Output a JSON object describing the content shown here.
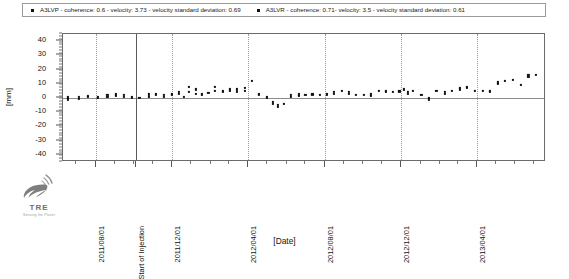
{
  "legend": {
    "entries": [
      {
        "marker": "square-marker",
        "text": "A3LVP - coherence: 0.6 - velocity: 3.73 - velocity standard deviation: 0.69"
      },
      {
        "marker": "square-marker",
        "text": "A3LVR - coherence: 0.71- velocity: 3.5 - velocity standard deviation: 0.61"
      }
    ]
  },
  "logo": {
    "name": "TRE",
    "tagline": "Sensing the Planet"
  },
  "axes": {
    "y_title": "[mm]",
    "x_title": "[Date]"
  },
  "chart_data": {
    "type": "scatter",
    "title": "",
    "subtitle": "",
    "xlabel": "[Date]",
    "ylabel": "[mm]",
    "grid": true,
    "legend_position": "top",
    "ylim": [
      -45,
      45
    ],
    "yticks": [
      40,
      30,
      20,
      10,
      0,
      -10,
      -20,
      -30,
      -40
    ],
    "ytick_labels": [
      "40",
      "30",
      "20",
      "10",
      "0",
      "-10",
      "-20",
      "-30",
      "-40"
    ],
    "y_minor_step": 2,
    "xlim": [
      "2011/06/10",
      "2013/07/20"
    ],
    "xticks": [
      "2011/08/01",
      "2011/12/01",
      "2012/04/01",
      "2012/08/01",
      "2012/12/01",
      "2013/04/01"
    ],
    "xtick_labels": [
      "2011/08/01",
      "2011/12/01",
      "2012/04/01",
      "2012/08/01",
      "2012/12/01",
      "2013/04/01"
    ],
    "annotations": [
      {
        "type": "vline",
        "label": "Start of Injection",
        "x": "2011/10/05"
      }
    ],
    "series": [
      {
        "name": "A3LVP",
        "coherence": 0.6,
        "velocity": 3.73,
        "velocity_standard_deviation": 0.69,
        "marker": "square",
        "color": "#111111",
        "points": [
          {
            "x": "2011/06/18",
            "y": 1.0
          },
          {
            "x": "2011/06/18",
            "y": -1.0
          },
          {
            "x": "2011/07/05",
            "y": 0.5
          },
          {
            "x": "2011/07/20",
            "y": 1.5
          },
          {
            "x": "2011/08/05",
            "y": 1.0
          },
          {
            "x": "2011/08/20",
            "y": 2.0
          },
          {
            "x": "2011/09/02",
            "y": 2.5
          },
          {
            "x": "2011/09/15",
            "y": 2.0
          },
          {
            "x": "2011/09/28",
            "y": 1.0
          },
          {
            "x": "2011/10/25",
            "y": 2.5
          },
          {
            "x": "2011/11/05",
            "y": 3.0
          },
          {
            "x": "2011/11/18",
            "y": 2.0
          },
          {
            "x": "2011/12/01",
            "y": 3.0
          },
          {
            "x": "2011/12/12",
            "y": 4.5
          },
          {
            "x": "2011/12/20",
            "y": 1.0
          },
          {
            "x": "2011/12/28",
            "y": 8.0
          },
          {
            "x": "2012/01/08",
            "y": 6.0
          },
          {
            "x": "2012/01/18",
            "y": 3.0
          },
          {
            "x": "2012/01/28",
            "y": 3.5
          },
          {
            "x": "2012/02/08",
            "y": 8.0
          },
          {
            "x": "2012/02/20",
            "y": 5.0
          },
          {
            "x": "2012/03/02",
            "y": 6.0
          },
          {
            "x": "2012/03/14",
            "y": 6.0
          },
          {
            "x": "2012/03/26",
            "y": 7.0
          },
          {
            "x": "2012/04/06",
            "y": 12.0
          },
          {
            "x": "2012/04/18",
            "y": 3.0
          },
          {
            "x": "2012/04/30",
            "y": 1.0
          },
          {
            "x": "2012/05/10",
            "y": -3.0
          },
          {
            "x": "2012/05/18",
            "y": -5.0
          },
          {
            "x": "2012/05/28",
            "y": -4.0
          },
          {
            "x": "2012/06/08",
            "y": 2.0
          },
          {
            "x": "2012/06/20",
            "y": 2.5
          },
          {
            "x": "2012/07/01",
            "y": 2.0
          },
          {
            "x": "2012/07/12",
            "y": 3.0
          },
          {
            "x": "2012/07/24",
            "y": 2.0
          },
          {
            "x": "2012/08/04",
            "y": 3.0
          },
          {
            "x": "2012/08/16",
            "y": 4.0
          },
          {
            "x": "2012/08/28",
            "y": 5.0
          },
          {
            "x": "2012/09/08",
            "y": 4.0
          },
          {
            "x": "2012/09/20",
            "y": 2.0
          },
          {
            "x": "2012/10/02",
            "y": 2.0
          },
          {
            "x": "2012/10/14",
            "y": 2.5
          },
          {
            "x": "2012/10/26",
            "y": 5.0
          },
          {
            "x": "2012/11/06",
            "y": 5.0
          },
          {
            "x": "2012/11/18",
            "y": 4.5
          },
          {
            "x": "2012/11/28",
            "y": 5.0
          },
          {
            "x": "2012/12/05",
            "y": 6.0
          },
          {
            "x": "2012/12/12",
            "y": 4.0
          },
          {
            "x": "2012/12/20",
            "y": 5.0
          },
          {
            "x": "2013/01/02",
            "y": 2.0
          },
          {
            "x": "2013/01/14",
            "y": 0.0
          },
          {
            "x": "2013/01/26",
            "y": 5.0
          },
          {
            "x": "2013/02/08",
            "y": 4.0
          },
          {
            "x": "2013/02/20",
            "y": 5.0
          },
          {
            "x": "2013/03/04",
            "y": 7.0
          },
          {
            "x": "2013/03/16",
            "y": 8.0
          },
          {
            "x": "2013/03/28",
            "y": 5.0
          },
          {
            "x": "2013/04/10",
            "y": 5.0
          },
          {
            "x": "2013/04/22",
            "y": 5.0
          },
          {
            "x": "2013/05/04",
            "y": 11.0
          },
          {
            "x": "2013/05/16",
            "y": 12.0
          },
          {
            "x": "2013/05/28",
            "y": 13.0
          },
          {
            "x": "2013/06/10",
            "y": 9.0
          },
          {
            "x": "2013/06/22",
            "y": 16.0
          },
          {
            "x": "2013/07/04",
            "y": 16.0
          }
        ]
      },
      {
        "name": "A3LVR",
        "coherence": 0.71,
        "velocity": 3.5,
        "velocity_standard_deviation": 0.61,
        "marker": "square",
        "color": "#111111",
        "points": [
          {
            "x": "2011/06/18",
            "y": 0.0
          },
          {
            "x": "2011/07/05",
            "y": -0.5
          },
          {
            "x": "2011/07/20",
            "y": 0.5
          },
          {
            "x": "2011/08/05",
            "y": 0.0
          },
          {
            "x": "2011/08/20",
            "y": 1.0
          },
          {
            "x": "2011/09/02",
            "y": 1.5
          },
          {
            "x": "2011/09/15",
            "y": 1.0
          },
          {
            "x": "2011/09/28",
            "y": 0.0
          },
          {
            "x": "2011/10/10",
            "y": 0.0
          },
          {
            "x": "2011/10/25",
            "y": 1.0
          },
          {
            "x": "2011/11/05",
            "y": 2.0
          },
          {
            "x": "2011/11/18",
            "y": 1.0
          },
          {
            "x": "2011/12/01",
            "y": 2.0
          },
          {
            "x": "2011/12/12",
            "y": 3.0
          },
          {
            "x": "2011/12/28",
            "y": 4.0
          },
          {
            "x": "2012/01/08",
            "y": 3.0
          },
          {
            "x": "2012/01/18",
            "y": 2.0
          },
          {
            "x": "2012/02/08",
            "y": 5.0
          },
          {
            "x": "2012/02/20",
            "y": 4.0
          },
          {
            "x": "2012/03/02",
            "y": 5.0
          },
          {
            "x": "2012/03/14",
            "y": 4.0
          },
          {
            "x": "2012/03/26",
            "y": 5.0
          },
          {
            "x": "2012/04/18",
            "y": 2.0
          },
          {
            "x": "2012/04/30",
            "y": 0.0
          },
          {
            "x": "2012/05/10",
            "y": -4.0
          },
          {
            "x": "2012/05/18",
            "y": -6.0
          },
          {
            "x": "2012/06/08",
            "y": 1.0
          },
          {
            "x": "2012/06/20",
            "y": 1.5
          },
          {
            "x": "2012/07/12",
            "y": 2.0
          },
          {
            "x": "2012/08/04",
            "y": 2.0
          },
          {
            "x": "2012/08/16",
            "y": 3.0
          },
          {
            "x": "2012/09/08",
            "y": 3.0
          },
          {
            "x": "2012/10/14",
            "y": 1.5
          },
          {
            "x": "2012/11/06",
            "y": 4.0
          },
          {
            "x": "2012/11/28",
            "y": 4.0
          },
          {
            "x": "2012/12/12",
            "y": 3.0
          },
          {
            "x": "2013/01/14",
            "y": -1.0
          },
          {
            "x": "2013/02/08",
            "y": 3.0
          },
          {
            "x": "2013/03/04",
            "y": 6.0
          },
          {
            "x": "2013/03/16",
            "y": 7.0
          },
          {
            "x": "2013/04/22",
            "y": 4.0
          },
          {
            "x": "2013/05/04",
            "y": 10.0
          },
          {
            "x": "2013/06/22",
            "y": 15.0
          }
        ]
      }
    ]
  }
}
